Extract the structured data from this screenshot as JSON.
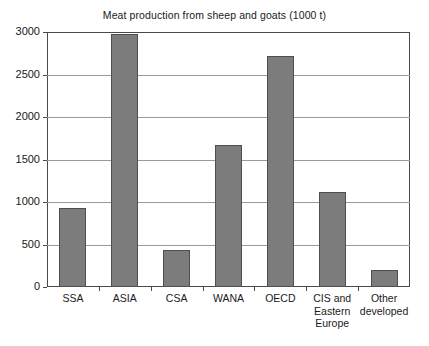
{
  "chart_data": {
    "type": "bar",
    "title": "Meat production from sheep and goats (1000 t)",
    "xlabel": "",
    "ylabel": "",
    "categories": [
      "SSA",
      "ASIA",
      "CSA",
      "WANA",
      "OECD",
      "CIS and Eastern Europe",
      "Other developed"
    ],
    "category_label_lines": [
      [
        "SSA"
      ],
      [
        "ASIA"
      ],
      [
        "CSA"
      ],
      [
        "WANA"
      ],
      [
        "OECD"
      ],
      [
        "CIS and",
        "Eastern",
        "Europe"
      ],
      [
        "Other",
        "developed"
      ]
    ],
    "values": [
      930,
      2975,
      435,
      1670,
      2712,
      1118,
      200
    ],
    "ylim": [
      0,
      3000
    ],
    "ytick_labels": [
      "0",
      "500",
      "1000",
      "1500",
      "2000",
      "2500",
      "3000"
    ],
    "ytick_values": [
      0,
      500,
      1000,
      1500,
      2000,
      2500,
      3000
    ],
    "grid": true,
    "legend": "none",
    "bar_color": "#7c7c7c",
    "bar_border_color": "#4f4f4f",
    "axis_color": "#4a4a4a",
    "grid_color": "#9a9a9a",
    "background_color": "#ffffff"
  }
}
